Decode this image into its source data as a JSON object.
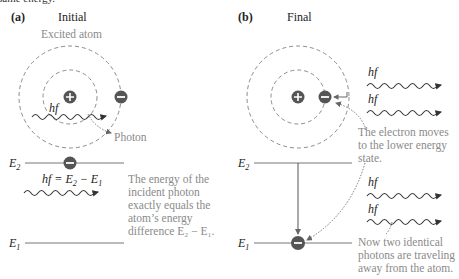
{
  "top_cutoff_text": "same energy.",
  "panel_a": {
    "letter": "(a)",
    "title": "Initial",
    "atom_label": "Excited atom",
    "photon_symbol": "hf",
    "photon_label": "Photon",
    "level_upper": "E",
    "level_upper_sub": "2",
    "level_lower": "E",
    "level_lower_sub": "1",
    "equation": {
      "lhs": "hf = E",
      "sub1": "2",
      "mid": " − E",
      "sub2": "1"
    },
    "caption": [
      "The energy of the",
      "incident photon",
      "exactly equals the",
      "atom’s energy",
      "difference E₂ − E₁."
    ]
  },
  "panel_b": {
    "letter": "(b)",
    "title": "Final",
    "photon_symbol": "hf",
    "level_upper": "E",
    "level_upper_sub": "2",
    "level_lower": "E",
    "level_lower_sub": "1",
    "caption_top": [
      "The electron moves",
      "to the lower energy",
      "state."
    ],
    "caption_bottom": [
      "Now two identical",
      "photons are traveling",
      "away from the atom."
    ]
  },
  "colors": {
    "charge": "#555555",
    "annotation_text": "#8a8a8a",
    "orbit": "#8c8c8c"
  }
}
